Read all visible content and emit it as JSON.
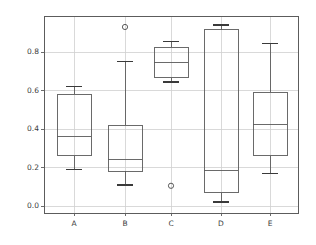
{
  "chart_data": {
    "type": "box",
    "title": "",
    "xlabel": "",
    "ylabel": "",
    "categories": [
      "A",
      "B",
      "C",
      "D",
      "E"
    ],
    "ylim": [
      -0.035,
      0.985
    ],
    "yticks": [
      0.0,
      0.2,
      0.4,
      0.6,
      0.8
    ],
    "ytick_labels": [
      "0.0",
      "0.2",
      "0.4",
      "0.6",
      "0.8"
    ],
    "grid": true,
    "grid_axis": "y",
    "legend": null,
    "boxes": [
      {
        "label": "A",
        "whisker_low": 0.19,
        "q1": 0.26,
        "median": 0.36,
        "q3": 0.58,
        "whisker_high": 0.62,
        "outliers": []
      },
      {
        "label": "B",
        "whisker_low": 0.11,
        "q1": 0.18,
        "median": 0.24,
        "q3": 0.42,
        "whisker_high": 0.75,
        "outliers": [
          0.93
        ]
      },
      {
        "label": "C",
        "whisker_low": 0.645,
        "q1": 0.665,
        "median": 0.745,
        "q3": 0.825,
        "whisker_high": 0.855,
        "outliers": [
          0.105
        ]
      },
      {
        "label": "D",
        "whisker_low": 0.02,
        "q1": 0.07,
        "median": 0.185,
        "q3": 0.915,
        "whisker_high": 0.94,
        "outliers": []
      },
      {
        "label": "E",
        "whisker_low": 0.17,
        "q1": 0.26,
        "median": 0.425,
        "q3": 0.59,
        "whisker_high": 0.845,
        "outliers": []
      }
    ],
    "colors": {
      "box_edge": "#5a5a5a",
      "median": "#5a5a5a",
      "whisker": "#5a5a5a",
      "cap": "#3a3a3a",
      "flier_edge": "#4a4a4a",
      "grid": "#cfcfcf",
      "axes_edge": "#5c5c5c",
      "background": "#ffffff",
      "tick_text": "#3b3b3b"
    }
  },
  "axes": {
    "left_px": 44,
    "right_px": 298,
    "top_px": 16,
    "bottom_px": 213,
    "y_zero_px": 206,
    "y_unit_px": 192.5,
    "box_width_px": 34,
    "cap_width_px": 16,
    "category_x_px": [
      74,
      125,
      171,
      221,
      270
    ],
    "xtick_label_y_px": 219,
    "ytick_label_x_right_px": 39
  }
}
